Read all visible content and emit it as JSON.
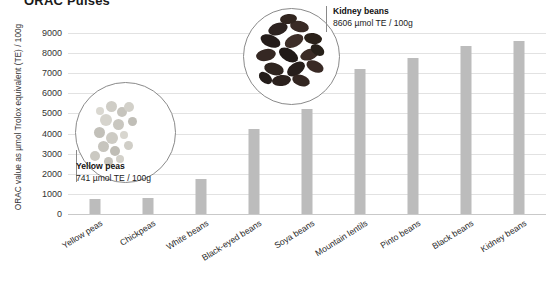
{
  "chart_title": "ORAC Pulses",
  "chart_data": {
    "type": "bar",
    "title": "ORAC Pulses",
    "xlabel": "",
    "ylabel": "ORAC value as µmol Trolox equivalent (TE) / 100g",
    "ylim": [
      0,
      9000
    ],
    "ytick_step": 1000,
    "grid": true,
    "legend": "none",
    "bar_color": "#bcbcbc",
    "gridline_color": "#e2e2e2",
    "categories": [
      "Yellow peas",
      "Chickpeas",
      "White beans",
      "Black-eyed beans",
      "Soya beans",
      "Mountain lentils",
      "Pinto beans",
      "Black beans",
      "Kidney beans"
    ],
    "values": [
      741,
      780,
      1750,
      4230,
      5230,
      7200,
      7750,
      8350,
      8606
    ],
    "yticks": [
      "0",
      "1000",
      "2000",
      "3000",
      "4000",
      "5000",
      "6000",
      "7000",
      "8000",
      "9000"
    ],
    "annotations": [
      {
        "name": "Yellow peas",
        "value_text": "741 µmol TE / 100g",
        "target_category": "Yellow peas",
        "image": "yellow-peas-photo"
      },
      {
        "name": "Kidney beans",
        "value_text": "8606 µmol TE / 100g",
        "target_category": "Kidney beans",
        "image": "kidney-beans-photo"
      }
    ]
  }
}
